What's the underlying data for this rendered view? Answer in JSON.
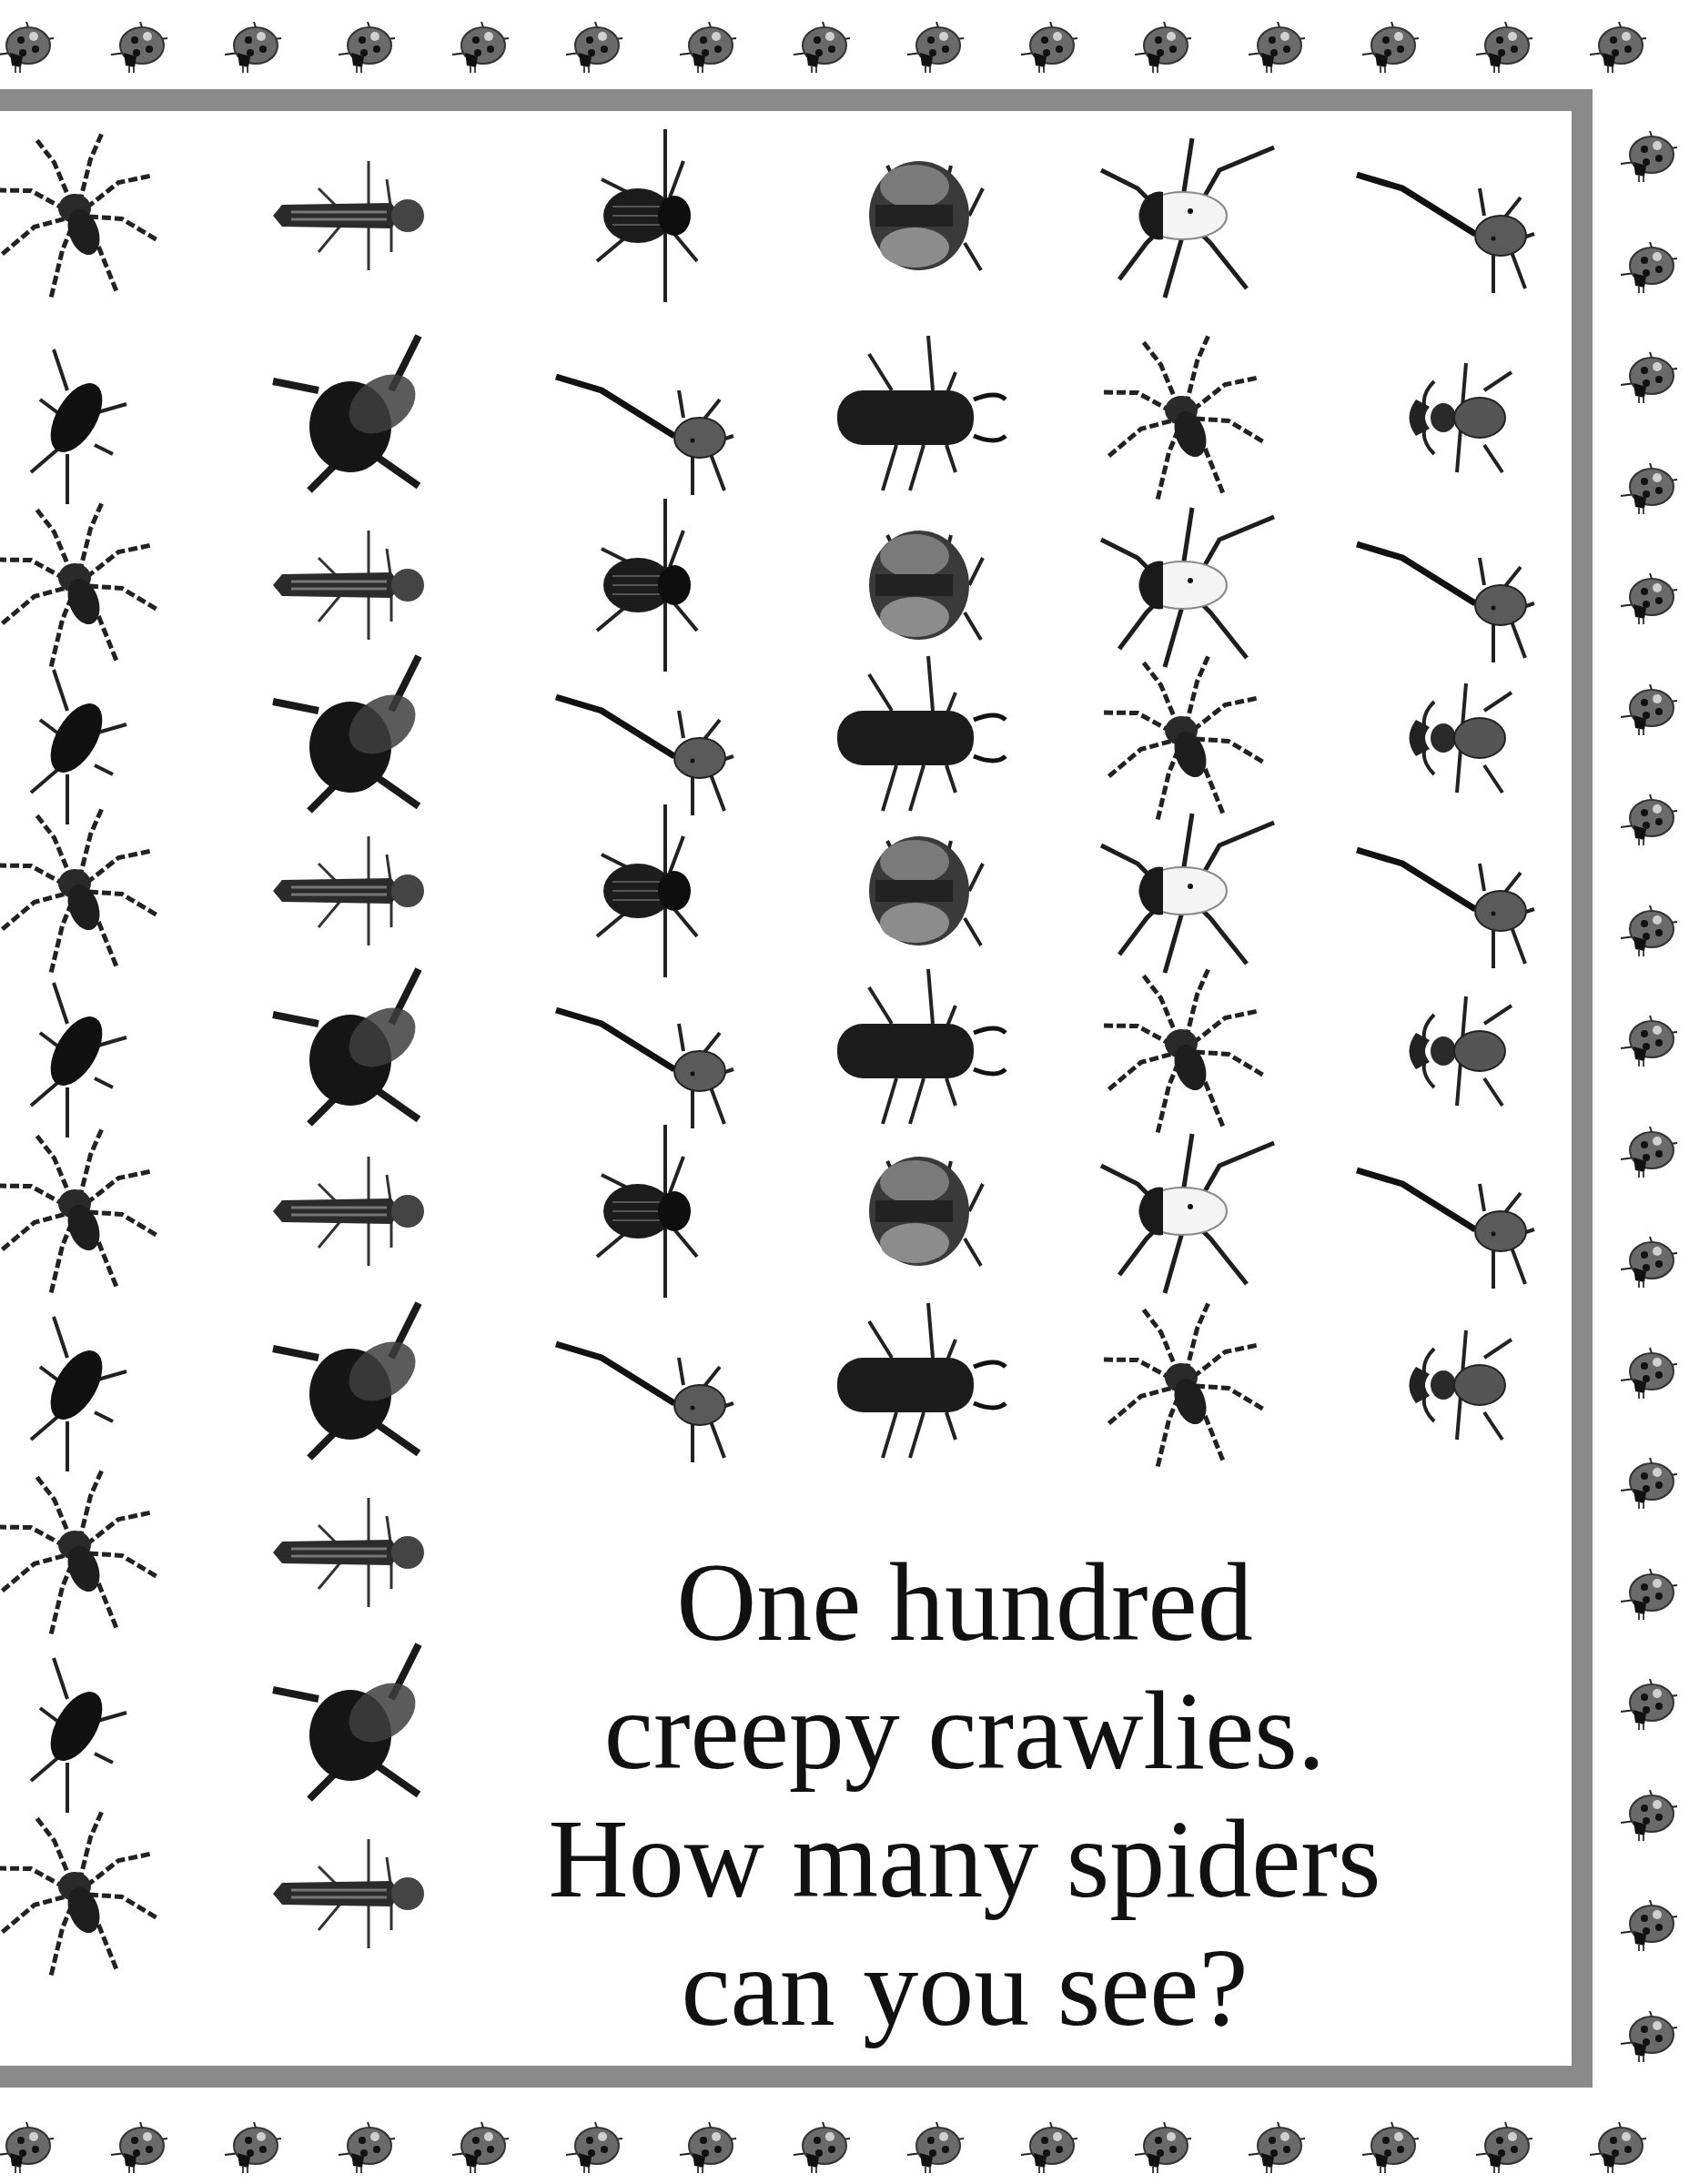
{
  "page": {
    "caption_lines": [
      "One hundred",
      "creepy crawlies.",
      "How many spiders",
      "can you see?"
    ],
    "colors": {
      "frame": "#8a8a8a",
      "background": "#ffffff",
      "text": "#111111"
    }
  },
  "border_decoration": {
    "icon": "ladybug-icon",
    "top_row_count": 15,
    "right_column_count": 18,
    "bottom_row_count": 15
  },
  "grid": {
    "columns": 6,
    "rows": [
      [
        "spider",
        "dragonfly-larva",
        "weevil",
        "tortoise-beetle",
        "white-beetle",
        "giraffe-weevil"
      ],
      [
        "shield-bug",
        "bumblebee",
        "giraffe-weevil",
        "hairy-larva",
        "spider",
        "stag-beetle"
      ],
      [
        "spider",
        "dragonfly-larva",
        "weevil",
        "tortoise-beetle",
        "white-beetle",
        "giraffe-weevil"
      ],
      [
        "shield-bug",
        "bumblebee",
        "giraffe-weevil",
        "hairy-larva",
        "spider",
        "stag-beetle"
      ],
      [
        "spider",
        "dragonfly-larva",
        "weevil",
        "tortoise-beetle",
        "white-beetle",
        "giraffe-weevil"
      ],
      [
        "shield-bug",
        "bumblebee",
        "giraffe-weevil",
        "hairy-larva",
        "spider",
        "stag-beetle"
      ],
      [
        "spider",
        "dragonfly-larva",
        "weevil",
        "tortoise-beetle",
        "white-beetle",
        "giraffe-weevil"
      ],
      [
        "shield-bug",
        "bumblebee",
        "giraffe-weevil",
        "hairy-larva",
        "spider",
        "stag-beetle"
      ],
      [
        "spider",
        "dragonfly-larva"
      ],
      [
        "shield-bug",
        "bumblebee"
      ],
      [
        "spider",
        "dragonfly-larva"
      ]
    ]
  }
}
